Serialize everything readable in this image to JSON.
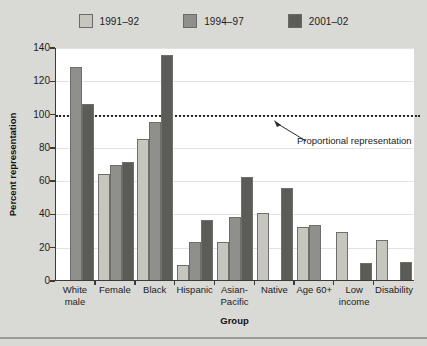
{
  "chart_data": {
    "type": "bar",
    "title": "",
    "xlabel": "Group",
    "ylabel": "Percent representation",
    "ylim": [
      0,
      140
    ],
    "ytick_step": 20,
    "yticks": [
      0,
      20,
      40,
      60,
      80,
      100,
      120,
      140
    ],
    "grid": true,
    "legend_position": "top-center",
    "categories": [
      "White male",
      "Female",
      "Black",
      "Hispanic",
      "Asian-Pacific",
      "Native",
      "Age 60+",
      "Low income",
      "Disability"
    ],
    "category_lines": [
      [
        "White",
        "male"
      ],
      [
        "Female",
        ""
      ],
      [
        "Black",
        ""
      ],
      [
        "Hispanic",
        ""
      ],
      [
        "Asian-",
        "Pacific"
      ],
      [
        "Native",
        ""
      ],
      [
        "Age 60+",
        ""
      ],
      [
        "Low",
        "income"
      ],
      [
        "Disability",
        ""
      ]
    ],
    "series": [
      {
        "name": "1991–92",
        "color": "#c6c6be",
        "values": [
          null,
          64,
          85,
          9,
          23,
          40,
          32,
          29,
          24
        ]
      },
      {
        "name": "1994–97",
        "color": "#8f8f8b",
        "values": [
          128,
          69,
          95,
          23,
          38,
          null,
          33,
          null,
          null
        ]
      },
      {
        "name": "2001–02",
        "color": "#5b5b58",
        "values": [
          106,
          71,
          135,
          36,
          62,
          55,
          null,
          10,
          11
        ]
      }
    ],
    "annotations": [
      {
        "text": "Proportional representation",
        "value": 100,
        "style": "dotted-reference-line"
      }
    ]
  },
  "colors": {
    "page_background": "#d9d9d6",
    "plot_background": "#ffffff",
    "axis": "#3a3a3a",
    "gridline": "#e2e2e2",
    "reference_line": "#2a2a2a",
    "text": "#1c1c1c"
  }
}
